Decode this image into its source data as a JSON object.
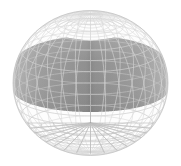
{
  "figure": {
    "type": "parametric-surface-3d",
    "background_color": "#ffffff",
    "canvas": {
      "width": 181,
      "height": 166
    }
  },
  "chart_data": {
    "type": "scatter",
    "title": "",
    "subtitle": "",
    "xlabel": "",
    "ylabel": "",
    "tick_labels": [],
    "legend": [],
    "annotations": [],
    "grid": true,
    "legend_position": "none",
    "render": {
      "projection": "orthographic",
      "shape": "sphere",
      "center_x": 90.5,
      "center_y": 83.0,
      "radius_x": 77.5,
      "radius_y": 72.5,
      "camera_elevation_deg": 18,
      "mesh_u_count": 32,
      "mesh_v_count": 20,
      "top_pole": {
        "x": 90.5,
        "y": 22.0
      },
      "bottom_pole": {
        "x": 90.5,
        "y": 123.0
      },
      "cusp_apex": {
        "x": 90.5,
        "y": 41.0
      },
      "band_top_y": 36.0,
      "band_bottom_y": 112.0
    },
    "colors": {
      "background": "#ffffff",
      "shaded_band_light": "#b4b4b4",
      "shaded_band_mid": "#9c9c9c",
      "shaded_band_dark": "#8e8e8e",
      "shaded_band_seam": "#868686",
      "cap_fill": "#fdfdfd",
      "mesh_line_light": "#d9d9d9",
      "mesh_line_on_band": "#c4c4c4",
      "silhouette": "#c8c8c8",
      "pole_lines": "#bdbdbd"
    }
  }
}
